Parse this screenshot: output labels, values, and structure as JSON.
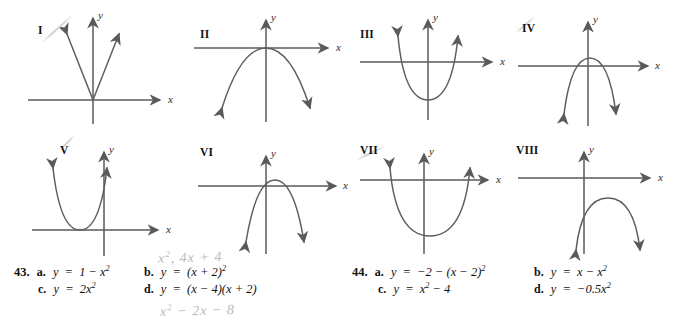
{
  "page": {
    "background": "#ffffff",
    "axis_color": "#5a5a5a",
    "curve_color": "#5e5e5e",
    "pencil_color": "#b9b9b9"
  },
  "graphs": [
    {
      "id": "graph-I",
      "label": "I",
      "x_axis_label": "x",
      "y_axis_label": "y",
      "description": "narrow upward parabola with vertex at the origin",
      "direction": "up",
      "vertex": [
        0,
        0
      ],
      "width": "narrow"
    },
    {
      "id": "graph-II",
      "label": "II",
      "x_axis_label": "x",
      "y_axis_label": "y",
      "description": "downward parabola with vertex at the origin",
      "direction": "down",
      "vertex": [
        0,
        0
      ],
      "width": "medium"
    },
    {
      "id": "graph-III",
      "label": "III",
      "x_axis_label": "x",
      "y_axis_label": "y",
      "description": "upward parabola with vertex on the y-axis below the x-axis",
      "direction": "up",
      "vertex": [
        0,
        -4
      ],
      "width": "medium"
    },
    {
      "id": "graph-IV",
      "label": "IV",
      "x_axis_label": "x",
      "y_axis_label": "y",
      "description": "narrow downward parabola with vertex just above the x-axis near the origin",
      "direction": "down",
      "vertex": [
        0.5,
        0.25
      ],
      "width": "narrow"
    },
    {
      "id": "graph-V",
      "label": "V",
      "x_axis_label": "x",
      "y_axis_label": "y",
      "description": "upward parabola tangent to the x-axis with vertex left of the origin",
      "direction": "up",
      "vertex": [
        -2,
        0
      ],
      "width": "narrow"
    },
    {
      "id": "graph-VI",
      "label": "VI",
      "x_axis_label": "x",
      "y_axis_label": "y",
      "description": "downward parabola with vertex just right of the y-axis slightly above the x-axis",
      "direction": "down",
      "vertex": [
        0.5,
        0.25
      ],
      "width": "narrow"
    },
    {
      "id": "graph-VII",
      "label": "VII",
      "x_axis_label": "x",
      "y_axis_label": "y",
      "description": "wide upward parabola with vertex well below the x-axis slightly right of the y-axis",
      "direction": "up",
      "vertex": [
        1,
        -9
      ],
      "width": "wide"
    },
    {
      "id": "graph-VIII",
      "label": "VIII",
      "x_axis_label": "x",
      "y_axis_label": "y",
      "description": "downward parabola with vertex below the x-axis to the right of the y-axis",
      "direction": "down",
      "vertex": [
        2,
        -2
      ],
      "width": "medium"
    }
  ],
  "exercises": [
    {
      "number": "43.",
      "items": [
        {
          "letter": "a.",
          "lhs": "y",
          "rel": "=",
          "rhs_html": "1 &minus; x<sup class=\"exp\">2</sup>"
        },
        {
          "letter": "b.",
          "lhs": "y",
          "rel": "=",
          "rhs_html": "(x + 2)<sup class=\"exp\">2</sup>"
        },
        {
          "letter": "c.",
          "lhs": "y",
          "rel": "=",
          "rhs_html": "2x<sup class=\"exp\">2</sup>"
        },
        {
          "letter": "d.",
          "lhs": "y",
          "rel": "=",
          "rhs_html": "(x &minus; 4)(x + 2)"
        }
      ]
    },
    {
      "number": "44.",
      "items": [
        {
          "letter": "a.",
          "lhs": "y",
          "rel": "=",
          "rhs_html": "&minus;2 &minus; (x &minus; 2)<sup class=\"exp\">2</sup>"
        },
        {
          "letter": "b.",
          "lhs": "y",
          "rel": "=",
          "rhs_html": "x &minus; x<sup class=\"exp\">2</sup>"
        },
        {
          "letter": "c.",
          "lhs": "y",
          "rel": "=",
          "rhs_html": "x<sup class=\"exp\">2</sup> &minus; 4"
        },
        {
          "letter": "d.",
          "lhs": "y",
          "rel": "=",
          "rhs_html": "&minus;0.5x<sup class=\"exp\">2</sup>"
        }
      ]
    }
  ],
  "annotations": [
    {
      "id": "pencil-expansion-top",
      "text_html": "x<sup>2</sup>, 4x + 4",
      "plain": "x2 + 4x + 4",
      "note": "handwritten expansion of (x + 2)^2"
    },
    {
      "id": "pencil-expansion-bottom",
      "text_html": "x<sup>2</sup> &minus; 2x &minus; 8",
      "plain": "x2 - 2x - 8",
      "note": "handwritten expansion of (x - 4)(x + 2)"
    }
  ]
}
